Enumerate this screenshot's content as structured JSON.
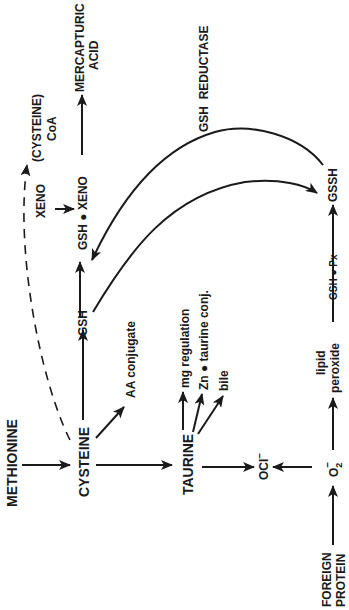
{
  "diagram": {
    "orientation": "rotated 90° counter-clockwise",
    "nodes": {
      "methionine": "METHIONINE",
      "cysteine": "CYSTEINE",
      "taurine": "TAURINE",
      "ocl": "OCl",
      "ocl_sup": "–",
      "o2": "O",
      "o2_sub": "2",
      "o2_sup": "–",
      "foreign_protein_1": "FOREIGN",
      "foreign_protein_2": "PROTEIN",
      "gsh_1": "GSH",
      "gsh_xeno": "GSH ● XENO",
      "xeno": "XENO",
      "cysteine_coa_1": "(CYSTEINE)",
      "cysteine_coa_2": "CoA",
      "mercapturic_1": "MERCAPTURIC",
      "mercapturic_2": "ACID",
      "gsh_reductase": "GSH  REDUCTASE",
      "gssh": "GSSH",
      "gsh_px": "GSH ● Px",
      "lipid_1": "lipid",
      "lipid_2": "peroxide",
      "aa_conjugate": "AA conjugate",
      "mg_regulation": "mg regulation",
      "zn_taurine": "Zn ● taurine conj.",
      "bile": "bile"
    },
    "edges": [
      {
        "from": "METHIONINE",
        "to": "CYSTEINE",
        "style": "solid"
      },
      {
        "from": "CYSTEINE",
        "to": "TAURINE",
        "style": "solid"
      },
      {
        "from": "CYSTEINE",
        "to": "GSH",
        "style": "solid"
      },
      {
        "from": "CYSTEINE",
        "to": "AA conjugate",
        "style": "solid"
      },
      {
        "from": "CYSTEINE",
        "to": "(CYSTEINE) CoA",
        "style": "dashed"
      },
      {
        "from": "GSH",
        "to": "GSH ● XENO",
        "style": "solid"
      },
      {
        "from": "XENO",
        "to": "GSH ● XENO",
        "style": "solid"
      },
      {
        "from": "GSH ● XENO",
        "to": "MERCAPTURIC ACID",
        "style": "solid"
      },
      {
        "from": "GSH",
        "to": "GSSH",
        "style": "curved"
      },
      {
        "from": "GSSH",
        "to": "GSH",
        "label": "GSH REDUCTASE",
        "style": "curved"
      },
      {
        "from": "TAURINE",
        "to": "mg regulation",
        "style": "solid"
      },
      {
        "from": "TAURINE",
        "to": "Zn ● taurine conj.",
        "style": "solid"
      },
      {
        "from": "TAURINE",
        "to": "bile",
        "style": "solid"
      },
      {
        "from": "TAURINE",
        "to": "OCl–",
        "style": "solid"
      },
      {
        "from": "O2–",
        "to": "OCl–",
        "style": "solid"
      },
      {
        "from": "FOREIGN PROTEIN",
        "to": "O2–",
        "style": "solid"
      },
      {
        "from": "O2–",
        "to": "lipid peroxide",
        "style": "solid"
      },
      {
        "from": "lipid peroxide",
        "to": "GSSH",
        "label": "GSH ● Px",
        "style": "solid"
      }
    ]
  }
}
